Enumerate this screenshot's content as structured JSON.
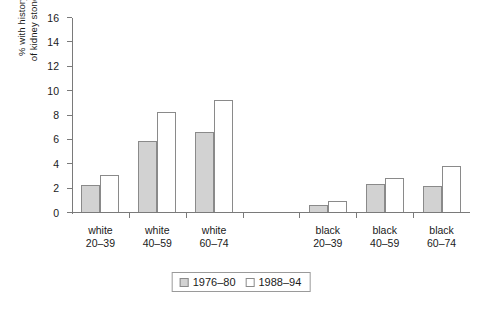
{
  "chart_data": {
    "type": "bar",
    "title": "",
    "xlabel": "",
    "ylabel": "% with history of kidney stones",
    "ylabel_lines": [
      "% with history",
      "of kidney stones"
    ],
    "categories": [
      "white 20–39",
      "white 40–59",
      "white 60–74",
      "black 20–39",
      "black 40–59",
      "black 60–74"
    ],
    "category_lines": [
      [
        "white",
        "20–39"
      ],
      [
        "white",
        "40–59"
      ],
      [
        "white",
        "60–74"
      ],
      [
        "black",
        "20–39"
      ],
      [
        "black",
        "40–59"
      ],
      [
        "black",
        "60–74"
      ]
    ],
    "series": [
      {
        "name": "1976–80",
        "color": "#d2d2d2",
        "values": [
          2.2,
          5.8,
          6.6,
          0.6,
          2.3,
          2.1
        ]
      },
      {
        "name": "1988–94",
        "color": "#ffffff",
        "values": [
          3.0,
          8.2,
          9.2,
          0.9,
          2.8,
          3.8
        ]
      }
    ],
    "ylim": [
      0,
      16
    ],
    "ytick_step": 2,
    "yticks": [
      0,
      2,
      4,
      6,
      8,
      10,
      12,
      14,
      16
    ],
    "ytick_labels": [
      "0",
      "2",
      "4",
      "6",
      "8",
      "10",
      "12",
      "14",
      "16"
    ],
    "grid": false,
    "legend_position": "bottom-center",
    "gap_after_category_index": 2
  },
  "axis": {
    "line_color": "#7a7a7a"
  },
  "legend": {
    "entries": [
      {
        "label": "1976–80",
        "swatch": "series-a"
      },
      {
        "label": "1988–94",
        "swatch": "series-b"
      }
    ]
  }
}
